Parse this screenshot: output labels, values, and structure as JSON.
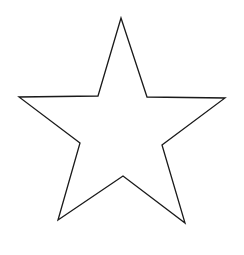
{
  "drawing": {
    "shape": "five-pointed star outline",
    "background_color": "#ffffff",
    "stroke_color": "#1a1a1a",
    "fill_color": "#ffffff",
    "stroke_width": 1.3,
    "points": [
      [
        121,
        18
      ],
      [
        147,
        97
      ],
      [
        225,
        98
      ],
      [
        162,
        145
      ],
      [
        185,
        223
      ],
      [
        123,
        176
      ],
      [
        58,
        220
      ],
      [
        80,
        143
      ],
      [
        19,
        97
      ],
      [
        98,
        96
      ]
    ]
  }
}
